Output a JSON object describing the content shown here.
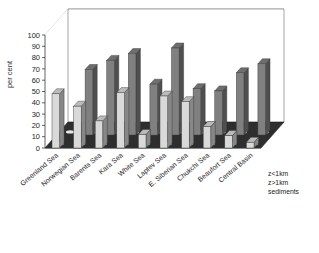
{
  "chart_data": {
    "type": "bar",
    "title": "30 Years",
    "xlabel": "",
    "ylabel": "per cent",
    "ylim": [
      0,
      100
    ],
    "yticks": [
      0,
      10,
      20,
      30,
      40,
      50,
      60,
      70,
      80,
      90,
      100
    ],
    "grid": true,
    "projection": "3d",
    "legend_position": "right-bottom",
    "categories": [
      "Greenland Sea",
      "Norwegian Sea",
      "Barents Sea",
      "Kara Sea",
      "White Sea",
      "Laptev Sea",
      "E. Siberian Sea",
      "Chukchi Sea",
      "Beaufort Sea",
      "Central Basin"
    ],
    "series": [
      {
        "name": "z<1km",
        "color": "#d9d9d9",
        "values": [
          48,
          37,
          24,
          49,
          12,
          46,
          41,
          19,
          11,
          5
        ]
      },
      {
        "name": "z>1km",
        "color": "#808080",
        "values": [
          0,
          58,
          66,
          72,
          45,
          77,
          41,
          39,
          55,
          63
        ]
      },
      {
        "name": "sediments",
        "color": "#f0f0f0",
        "values": [
          0,
          0,
          0,
          0,
          0,
          0,
          0,
          0,
          0,
          0
        ]
      }
    ],
    "legend": [
      "z<1km",
      "z>1km",
      "sediments"
    ]
  },
  "yaxis": {
    "labels": [
      "100",
      "90",
      "80",
      "70",
      "60",
      "50",
      "40",
      "30",
      "20",
      "10",
      "0"
    ],
    "title": "per cent"
  },
  "title_text": "30 Years",
  "legend_items": [
    {
      "label": "z<1km"
    },
    {
      "label": "z>1km"
    },
    {
      "label": "sediments"
    }
  ]
}
